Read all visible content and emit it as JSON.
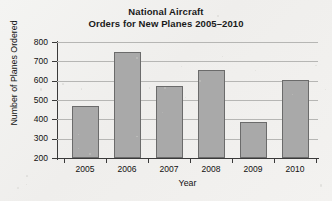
{
  "chart_data": {
    "type": "bar",
    "title": "National Aircraft Orders for New Planes 2005–2010",
    "title_line1": "National Aircraft",
    "title_line2": "Orders for New Planes 2005–2010",
    "xlabel": "Year",
    "ylabel": "Number of Planes Ordered",
    "categories": [
      "2005",
      "2006",
      "2007",
      "2008",
      "2009",
      "2010"
    ],
    "values": [
      470,
      750,
      570,
      655,
      385,
      605
    ],
    "ylim": [
      200,
      800
    ],
    "yticks": [
      200,
      300,
      400,
      500,
      600,
      700,
      800
    ],
    "ytick_labels": [
      "200",
      "300",
      "400",
      "500",
      "600",
      "700",
      "800"
    ],
    "grid": "horizontal",
    "legend": "none",
    "bar_color": "#a9a9a9",
    "bar_edge_color": "#6b6b6b",
    "axis_color": "#3a3a3a",
    "grid_color": "#b6b6b4",
    "background_color": "#f2f2f0"
  }
}
